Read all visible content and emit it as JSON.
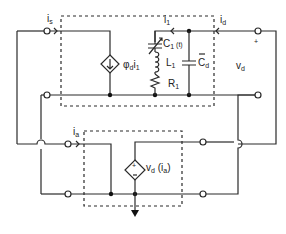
{
  "diagram": {
    "type": "circuit-schematic",
    "colors": {
      "line": "#2a2a2a",
      "background": "#ffffff"
    },
    "labels": {
      "is": {
        "main": "i",
        "sub": "s"
      },
      "i1": {
        "main": "i",
        "sub": "1"
      },
      "id": {
        "main": "i",
        "sub": "d"
      },
      "c1t": {
        "main": "C",
        "sub": "1",
        "tail": " (t)"
      },
      "l1": {
        "main": "L",
        "sub": "1"
      },
      "r1": {
        "main": "R",
        "sub": "1"
      },
      "cd": {
        "main": "C",
        "sub": "d"
      },
      "phi": {
        "main": "φ",
        "sub": "d",
        "tail": "i",
        "tailsub": "1"
      },
      "vd": {
        "main": "v",
        "sub": "d"
      },
      "plus": "+",
      "ia": {
        "main": "i",
        "sub": "a"
      },
      "vdia": {
        "main": "v",
        "sub": "d",
        "tail": " (i",
        "tailsub": "a",
        "close": ")"
      }
    },
    "components": [
      "dependent-current-source-phi-d-i1",
      "varactor-C1(t)",
      "inductor-L1",
      "resistor-R1",
      "capacitor-Cd",
      "dependent-voltage-source-vd(ia)"
    ]
  }
}
